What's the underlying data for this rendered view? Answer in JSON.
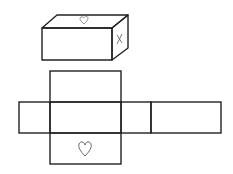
{
  "diagram": {
    "title": "",
    "colors": {
      "stroke": "#222222",
      "mark": "#777777",
      "background": "#ffffff"
    },
    "box": {
      "top_face_mark": "heart-icon",
      "side_face_mark": "x-mark",
      "side_face_label": "x"
    },
    "net": {
      "faces": [
        "top-flap",
        "left-flap",
        "center",
        "right-flap",
        "far-right-face",
        "bottom-flap"
      ],
      "bottom_flap_mark": "heart-icon"
    }
  }
}
